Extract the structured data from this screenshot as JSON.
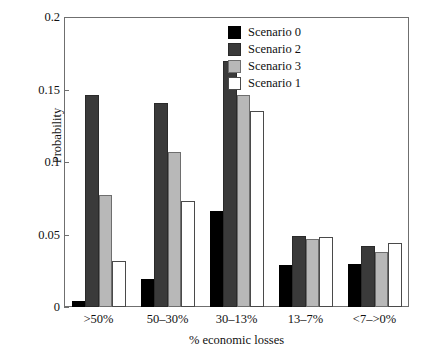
{
  "chart_data": {
    "type": "bar",
    "title": "",
    "xlabel": "% economic losses",
    "ylabel": "Probability",
    "categories": [
      ">50%",
      "50–30%",
      "30–13%",
      "13–7%",
      "<7–>0%"
    ],
    "ylim": [
      0,
      0.2
    ],
    "yticks": [
      "0",
      "0.05",
      "0.1",
      "0.15",
      "0.2"
    ],
    "ytick_values": [
      0,
      0.05,
      0.1,
      0.15,
      0.2
    ],
    "grid": false,
    "legend_position": "top-right",
    "series": [
      {
        "name": "Scenario 0",
        "color": "#000000",
        "style": "black",
        "values": [
          0.004,
          0.019,
          0.066,
          0.029,
          0.03
        ]
      },
      {
        "name": "Scenario 2",
        "color": "#3a3a3a",
        "style": "dark",
        "values": [
          0.146,
          0.141,
          0.17,
          0.049,
          0.042
        ]
      },
      {
        "name": "Scenario 3",
        "color": "#b8b8b8",
        "style": "light",
        "values": [
          0.077,
          0.107,
          0.146,
          0.047,
          0.038
        ]
      },
      {
        "name": "Scenario 1",
        "color": "#ffffff",
        "style": "white",
        "values": [
          0.032,
          0.073,
          0.135,
          0.048,
          0.044
        ]
      }
    ]
  }
}
